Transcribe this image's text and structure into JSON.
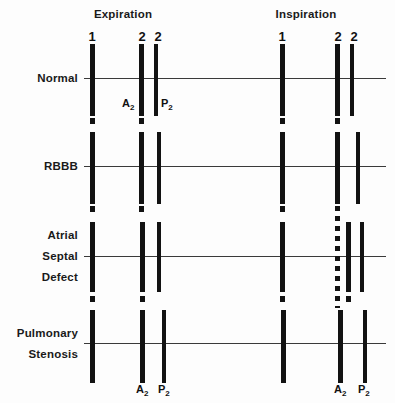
{
  "figure": {
    "background_color": "#fdfdfd",
    "ink_color": "#121212",
    "baseline_color": "#3a3a3a"
  },
  "phases": [
    {
      "id": "expiration",
      "label": "Expiration",
      "center_x": 123
    },
    {
      "id": "inspiration",
      "label": "Inspiration",
      "center_x": 306
    }
  ],
  "numerals": [
    {
      "text": "1",
      "x": 92,
      "y": 30,
      "phase": "expiration",
      "sound": "S1"
    },
    {
      "text": "2",
      "x": 142,
      "y": 30,
      "phase": "expiration",
      "sound": "A2"
    },
    {
      "text": "2",
      "x": 158,
      "y": 30,
      "phase": "expiration",
      "sound": "P2"
    },
    {
      "text": "1",
      "x": 282,
      "y": 30,
      "phase": "inspiration",
      "sound": "S1"
    },
    {
      "text": "2",
      "x": 338,
      "y": 30,
      "phase": "inspiration",
      "sound": "A2"
    },
    {
      "text": "2",
      "x": 354,
      "y": 30,
      "phase": "inspiration",
      "sound": "P2"
    }
  ],
  "rows": [
    {
      "id": "normal",
      "lines": [
        "Normal"
      ],
      "label_y": 78,
      "baseline_y": 78,
      "baseline_x": 84,
      "baseline_width": 302,
      "bars": [
        {
          "phase": "expiration",
          "sound": "S1",
          "x": 92,
          "top": 44,
          "height": 72,
          "width": 5,
          "style": "solid"
        },
        {
          "phase": "expiration",
          "sound": "A2",
          "x": 141,
          "top": 44,
          "height": 72,
          "width": 5,
          "style": "solid"
        },
        {
          "phase": "expiration",
          "sound": "P2",
          "x": 156,
          "top": 44,
          "height": 72,
          "width": 4.5,
          "style": "solid"
        },
        {
          "phase": "inspiration",
          "sound": "S1",
          "x": 282,
          "top": 44,
          "height": 72,
          "width": 5,
          "style": "solid"
        },
        {
          "phase": "inspiration",
          "sound": "A2",
          "x": 337,
          "top": 44,
          "height": 72,
          "width": 5,
          "style": "solid"
        },
        {
          "phase": "inspiration",
          "sound": "P2",
          "x": 352,
          "top": 44,
          "height": 72,
          "width": 4.5,
          "style": "solid"
        }
      ],
      "component_labels": [
        {
          "base": "A",
          "sub": "2",
          "x": 122,
          "y": 98,
          "phase": "expiration"
        },
        {
          "base": "P",
          "sub": "2",
          "x": 161,
          "y": 98,
          "phase": "expiration"
        }
      ]
    },
    {
      "id": "rbbb",
      "lines": [
        "RBBB"
      ],
      "label_y": 166,
      "baseline_y": 166,
      "baseline_x": 84,
      "baseline_width": 302,
      "bars": [
        {
          "phase": "expiration",
          "sound": "S1",
          "x": 92,
          "top": 132,
          "height": 72,
          "width": 5,
          "style": "solid"
        },
        {
          "phase": "expiration",
          "sound": "A2",
          "x": 141,
          "top": 132,
          "height": 72,
          "width": 5,
          "style": "solid"
        },
        {
          "phase": "expiration",
          "sound": "P2",
          "x": 159,
          "top": 132,
          "height": 72,
          "width": 4.5,
          "style": "solid"
        },
        {
          "phase": "inspiration",
          "sound": "S1",
          "x": 282,
          "top": 132,
          "height": 72,
          "width": 5,
          "style": "solid"
        },
        {
          "phase": "inspiration",
          "sound": "A2",
          "x": 337,
          "top": 132,
          "height": 72,
          "width": 5,
          "style": "solid"
        },
        {
          "phase": "inspiration",
          "sound": "P2",
          "x": 358,
          "top": 132,
          "height": 72,
          "width": 4.5,
          "style": "solid"
        }
      ],
      "component_labels": []
    },
    {
      "id": "atrial-septal-defect",
      "lines": [
        "Atrial",
        "Septal",
        "Defect"
      ],
      "label_y": 256,
      "baseline_y": 256,
      "baseline_x": 84,
      "baseline_width": 302,
      "bars": [
        {
          "phase": "expiration",
          "sound": "S1",
          "x": 92,
          "top": 222,
          "height": 70,
          "width": 5,
          "style": "solid"
        },
        {
          "phase": "expiration",
          "sound": "A2",
          "x": 142,
          "top": 222,
          "height": 70,
          "width": 5,
          "style": "solid"
        },
        {
          "phase": "expiration",
          "sound": "P2",
          "x": 159,
          "top": 222,
          "height": 70,
          "width": 4.5,
          "style": "solid"
        },
        {
          "phase": "inspiration",
          "sound": "S1",
          "x": 282,
          "top": 222,
          "height": 70,
          "width": 5,
          "style": "solid"
        },
        {
          "phase": "inspiration",
          "sound": "A2",
          "x": 337,
          "top": 206,
          "height": 102,
          "width": 5,
          "style": "dotted"
        },
        {
          "phase": "inspiration",
          "sound": "A2-solid",
          "x": 348,
          "top": 222,
          "height": 70,
          "width": 5,
          "style": "solid"
        },
        {
          "phase": "inspiration",
          "sound": "P2",
          "x": 362,
          "top": 222,
          "height": 70,
          "width": 4.5,
          "style": "solid"
        }
      ],
      "component_labels": []
    },
    {
      "id": "pulmonary-stenosis",
      "lines": [
        "Pulmonary",
        "Stenosis"
      ],
      "label_y": 343,
      "baseline_y": 343,
      "baseline_x": 84,
      "baseline_width": 302,
      "bars": [
        {
          "phase": "expiration",
          "sound": "S1",
          "x": 92,
          "top": 310,
          "height": 68,
          "width": 5,
          "style": "solid"
        },
        {
          "phase": "expiration",
          "sound": "A2",
          "x": 142,
          "top": 310,
          "height": 68,
          "width": 5,
          "style": "solid"
        },
        {
          "phase": "expiration",
          "sound": "P2",
          "x": 164,
          "top": 310,
          "height": 68,
          "width": 4.5,
          "style": "solid"
        },
        {
          "phase": "inspiration",
          "sound": "S1",
          "x": 283,
          "top": 310,
          "height": 68,
          "width": 5,
          "style": "solid"
        },
        {
          "phase": "inspiration",
          "sound": "A2",
          "x": 340,
          "top": 310,
          "height": 68,
          "width": 5,
          "style": "solid"
        },
        {
          "phase": "inspiration",
          "sound": "P2",
          "x": 365,
          "top": 310,
          "height": 68,
          "width": 4.5,
          "style": "solid"
        }
      ],
      "component_labels": [
        {
          "base": "A",
          "sub": "2",
          "x": 136,
          "y": 384,
          "phase": "expiration"
        },
        {
          "base": "P",
          "sub": "2",
          "x": 158,
          "y": 384,
          "phase": "expiration"
        },
        {
          "base": "A",
          "sub": "2",
          "x": 334,
          "y": 384,
          "phase": "inspiration"
        },
        {
          "base": "P",
          "sub": "2",
          "x": 358,
          "y": 384,
          "phase": "inspiration"
        }
      ]
    }
  ],
  "stubs": [
    {
      "x": 92,
      "y": 118,
      "w": 5,
      "h": 6
    },
    {
      "x": 141,
      "y": 118,
      "w": 5,
      "h": 6
    },
    {
      "x": 282,
      "y": 118,
      "w": 5,
      "h": 6
    },
    {
      "x": 337,
      "y": 118,
      "w": 5,
      "h": 6
    },
    {
      "x": 92,
      "y": 206,
      "w": 5,
      "h": 6
    },
    {
      "x": 141,
      "y": 206,
      "w": 5,
      "h": 6
    },
    {
      "x": 282,
      "y": 206,
      "w": 5,
      "h": 6
    },
    {
      "x": 92,
      "y": 296,
      "w": 5,
      "h": 6
    },
    {
      "x": 142,
      "y": 296,
      "w": 5,
      "h": 6
    },
    {
      "x": 282,
      "y": 296,
      "w": 5,
      "h": 6
    },
    {
      "x": 348,
      "y": 296,
      "w": 5,
      "h": 6
    },
    {
      "x": 92,
      "y": 378,
      "w": 5,
      "h": 5
    },
    {
      "x": 142,
      "y": 378,
      "w": 5,
      "h": 5
    },
    {
      "x": 164,
      "y": 378,
      "w": 4.5,
      "h": 5
    },
    {
      "x": 283,
      "y": 378,
      "w": 5,
      "h": 5
    },
    {
      "x": 340,
      "y": 378,
      "w": 5,
      "h": 5
    },
    {
      "x": 365,
      "y": 378,
      "w": 4.5,
      "h": 5
    }
  ]
}
